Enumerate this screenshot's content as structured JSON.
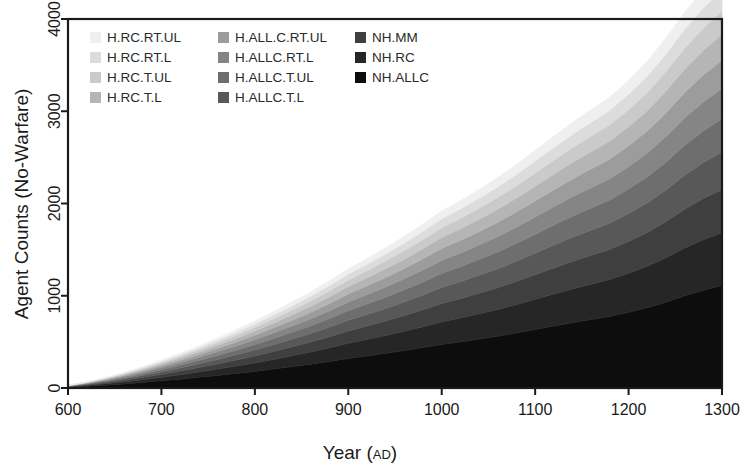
{
  "chart_data": {
    "type": "area",
    "stacked": true,
    "title": "",
    "xlabel": "Year (AD)",
    "ylabel": "Agent Counts (No-Warfare)",
    "xlim": [
      600,
      1300
    ],
    "ylim": [
      0,
      4000
    ],
    "xticks": [
      600,
      700,
      800,
      900,
      1000,
      1100,
      1200,
      1300
    ],
    "yticks": [
      0,
      1000,
      2000,
      3000,
      4000
    ],
    "grid": false,
    "legend_position": "top-left-inside",
    "legend_columns": 3,
    "x": [
      600,
      620,
      640,
      660,
      680,
      700,
      720,
      740,
      760,
      780,
      800,
      820,
      840,
      860,
      880,
      900,
      920,
      940,
      960,
      980,
      1000,
      1020,
      1040,
      1060,
      1080,
      1100,
      1120,
      1140,
      1150,
      1160,
      1180,
      1200,
      1220,
      1240,
      1260,
      1280,
      1300
    ],
    "series": [
      {
        "name": "NH.ALLC",
        "color": "#0d0d0d",
        "stack_order": 1,
        "values": [
          8,
          18,
          30,
          44,
          60,
          78,
          96,
          116,
          136,
          158,
          180,
          205,
          232,
          258,
          288,
          320,
          348,
          376,
          406,
          438,
          472,
          500,
          530,
          560,
          596,
          634,
          672,
          708,
          726,
          742,
          776,
          820,
          870,
          930,
          1000,
          1060,
          1110
        ]
      },
      {
        "name": "NH.RC",
        "color": "#262626",
        "stack_order": 2,
        "values": [
          4,
          9,
          15,
          22,
          30,
          39,
          48,
          58,
          69,
          80,
          92,
          105,
          118,
          132,
          148,
          164,
          178,
          193,
          209,
          226,
          244,
          258,
          274,
          290,
          308,
          327,
          347,
          366,
          375,
          383,
          401,
          424,
          450,
          481,
          517,
          548,
          574
        ]
      },
      {
        "name": "NH.MM",
        "color": "#3f3f3f",
        "stack_order": 3,
        "values": [
          3,
          7,
          12,
          18,
          24,
          31,
          39,
          47,
          56,
          65,
          75,
          85,
          96,
          108,
          120,
          134,
          145,
          157,
          170,
          184,
          199,
          210,
          223,
          236,
          251,
          266,
          283,
          298,
          305,
          312,
          326,
          345,
          366,
          392,
          421,
          446,
          467
        ]
      },
      {
        "name": "H.ALLC.T.L",
        "color": "#585858",
        "stack_order": 4,
        "values": [
          3,
          6,
          10,
          15,
          21,
          27,
          34,
          41,
          49,
          57,
          66,
          75,
          84,
          94,
          105,
          117,
          127,
          137,
          148,
          161,
          174,
          184,
          195,
          206,
          219,
          233,
          247,
          261,
          267,
          273,
          285,
          302,
          320,
          343,
          368,
          390,
          408
        ]
      },
      {
        "name": "H.ALLC.T.UL",
        "color": "#6e6e6e",
        "stack_order": 5,
        "values": [
          2,
          5,
          9,
          13,
          18,
          24,
          30,
          36,
          43,
          50,
          58,
          66,
          74,
          83,
          92,
          103,
          112,
          121,
          131,
          141,
          153,
          162,
          171,
          182,
          193,
          205,
          217,
          229,
          235,
          240,
          251,
          265,
          282,
          302,
          324,
          343,
          359
        ]
      },
      {
        "name": "H.ALLC.RT.L",
        "color": "#858585",
        "stack_order": 6,
        "values": [
          2,
          5,
          8,
          12,
          17,
          22,
          27,
          33,
          39,
          46,
          53,
          60,
          68,
          76,
          85,
          94,
          102,
          111,
          120,
          130,
          140,
          148,
          157,
          167,
          177,
          188,
          199,
          210,
          215,
          220,
          230,
          243,
          258,
          277,
          297,
          314,
          329
        ]
      },
      {
        "name": "H.ALL.C.RT.UL",
        "color": "#9c9c9c",
        "stack_order": 7,
        "values": [
          2,
          4,
          7,
          11,
          15,
          20,
          25,
          30,
          36,
          42,
          49,
          56,
          63,
          70,
          78,
          87,
          95,
          103,
          111,
          120,
          130,
          137,
          145,
          154,
          164,
          174,
          184,
          194,
          199,
          204,
          213,
          225,
          239,
          257,
          275,
          291,
          305
        ]
      },
      {
        "name": "H.RC.T.L",
        "color": "#b5b5b5",
        "stack_order": 8,
        "values": [
          2,
          4,
          7,
          10,
          14,
          18,
          23,
          28,
          33,
          39,
          45,
          51,
          58,
          65,
          72,
          80,
          87,
          94,
          102,
          110,
          119,
          126,
          133,
          142,
          150,
          160,
          169,
          178,
          183,
          187,
          196,
          207,
          220,
          236,
          253,
          268,
          281
        ]
      },
      {
        "name": "H.RC.T.UL",
        "color": "#cacaca",
        "stack_order": 9,
        "values": [
          1,
          3,
          6,
          9,
          12,
          16,
          20,
          25,
          30,
          35,
          40,
          46,
          52,
          58,
          65,
          72,
          78,
          85,
          92,
          99,
          107,
          113,
          120,
          127,
          135,
          144,
          152,
          160,
          164,
          168,
          176,
          186,
          198,
          212,
          228,
          241,
          253
        ]
      },
      {
        "name": "H.RC.RT.L",
        "color": "#dcdcdc",
        "stack_order": 10,
        "values": [
          1,
          3,
          5,
          8,
          11,
          14,
          18,
          22,
          27,
          31,
          36,
          41,
          47,
          52,
          58,
          65,
          70,
          76,
          82,
          89,
          96,
          102,
          108,
          115,
          121,
          129,
          137,
          144,
          148,
          151,
          158,
          167,
          178,
          191,
          205,
          217,
          228
        ]
      },
      {
        "name": "H.RC.RT.UL",
        "color": "#efefef",
        "stack_order": 11,
        "values": [
          1,
          2,
          4,
          7,
          9,
          12,
          16,
          20,
          24,
          28,
          32,
          37,
          42,
          47,
          52,
          58,
          63,
          68,
          74,
          80,
          86,
          91,
          97,
          103,
          109,
          116,
          123,
          130,
          133,
          136,
          142,
          150,
          160,
          172,
          184,
          195,
          205
        ]
      }
    ],
    "total_at_1300": 4319,
    "annotations": [
      {
        "label": "dip",
        "x": 1150,
        "note": "visible notch in upper bands near 1150"
      }
    ]
  },
  "legend": {
    "columns": [
      {
        "items": [
          {
            "label": "H.RC.RT.UL",
            "color": "#efefef"
          },
          {
            "label": "H.RC.RT.L",
            "color": "#dcdcdc"
          },
          {
            "label": "H.RC.T.UL",
            "color": "#cacaca"
          },
          {
            "label": "H.RC.T.L",
            "color": "#b5b5b5"
          }
        ]
      },
      {
        "items": [
          {
            "label": "H.ALL.C.RT.UL",
            "color": "#9c9c9c"
          },
          {
            "label": "H.ALLC.RT.L",
            "color": "#858585"
          },
          {
            "label": "H.ALLC.T.UL",
            "color": "#6e6e6e"
          },
          {
            "label": "H.ALLC.T.L",
            "color": "#585858"
          }
        ]
      },
      {
        "items": [
          {
            "label": "NH.MM",
            "color": "#3f3f3f"
          },
          {
            "label": "NH.RC",
            "color": "#262626"
          },
          {
            "label": "NH.ALLC",
            "color": "#0d0d0d"
          }
        ]
      }
    ]
  },
  "axes": {
    "y_title": "Agent Counts (No-Warfare)",
    "x_title_main": "Year",
    "x_title_paren_open": "(",
    "x_title_ad": "AD",
    "x_title_paren_close": ")",
    "x_tick_labels": [
      "600",
      "700",
      "800",
      "900",
      "1000",
      "1100",
      "1200",
      "1300"
    ],
    "y_tick_labels": [
      "0",
      "1000",
      "2000",
      "3000",
      "4000"
    ]
  },
  "style": {
    "background": "#ffffff",
    "frame_color": "#1a1a1a",
    "text_color": "#1a1a1a"
  }
}
